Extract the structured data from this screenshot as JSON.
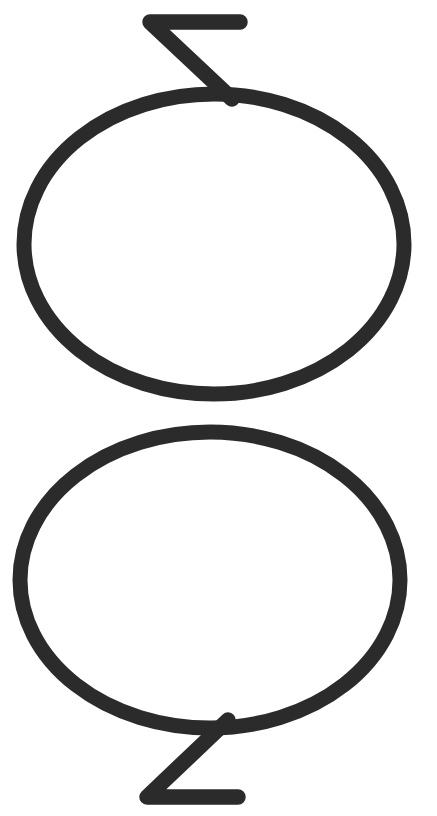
{
  "canvas": {
    "width": 437,
    "height": 816,
    "background_color": "#ffffff",
    "stroke_color": "#2b2b2b",
    "stroke_width": 15,
    "title": "Two-ellipse zigzag logo mark"
  },
  "artwork": {
    "type": "line-art-mark",
    "description": "Two large overlapping outlined ellipses stacked vertically, joined near their right sides, with a zigzag stroke extending up from the top ellipse and a mirrored zigzag extending down from the bottom ellipse",
    "shapes": [
      {
        "name": "upper-ellipse",
        "kind": "ellipse",
        "cx": 214,
        "cy": 244,
        "rx": 190,
        "ry": 150,
        "fill": "none",
        "stroke": "#2b2b2b"
      },
      {
        "name": "lower-ellipse",
        "kind": "ellipse",
        "cx": 210,
        "cy": 580,
        "rx": 190,
        "ry": 148,
        "fill": "none",
        "stroke": "#2b2b2b"
      },
      {
        "name": "top-zigzag",
        "kind": "polyline",
        "points": "240,22 150,22 232,99",
        "stroke": "#2b2b2b"
      },
      {
        "name": "bottom-zigzag",
        "kind": "polyline",
        "points": "228,720 147,797 238,797",
        "stroke": "#2b2b2b"
      }
    ]
  }
}
